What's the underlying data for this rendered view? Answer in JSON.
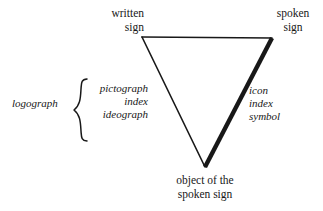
{
  "diagram": {
    "background_color": "#ffffff",
    "ink_color": "#181818",
    "vertices": {
      "top_left": {
        "label_line1": "written",
        "label_line2": "sign",
        "x": 142,
        "y": 37
      },
      "top_right": {
        "label_line1": "spoken",
        "label_line2": "sign",
        "x": 272,
        "y": 38
      },
      "bottom": {
        "label_line1": "object of the",
        "label_line2": "spoken sign",
        "x": 205,
        "y": 167
      }
    },
    "edges": [
      {
        "name": "top-edge",
        "from": "top_left",
        "to": "top_right",
        "stroke_width": 1.6
      },
      {
        "name": "left-edge",
        "from": "top_left",
        "to": "bottom",
        "stroke_width": 1.6
      },
      {
        "name": "right-edge",
        "from": "top_right",
        "to": "bottom",
        "stroke_width": 4.2
      }
    ],
    "left_group": {
      "category_label": "logograph",
      "brace": "{",
      "terms": [
        "pictograph",
        "index",
        "ideograph"
      ]
    },
    "right_group": {
      "terms": [
        "icon",
        "index",
        "symbol"
      ]
    }
  }
}
